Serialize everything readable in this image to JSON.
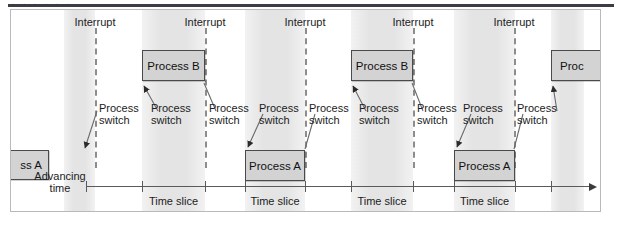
{
  "figure": {
    "caption_remnant": "· · · · · ·",
    "axis_label_line1": "Advancing",
    "axis_label_line2": "time",
    "interrupt_label": "Interrupt",
    "process_switch_line1": "Process",
    "process_switch_line2": "switch",
    "time_slice_label": "Time slice",
    "colors": {
      "band_gray": "#e9e9e9",
      "box_fill": "#d3d3d3",
      "box_border": "#4a4a4a",
      "dash_line": "#8d8d8d",
      "axis": "#5a5a5a",
      "rule": "#3c3c44",
      "frame": "#b9b9b9"
    }
  },
  "interrupts": [
    {
      "label": "Interrupt",
      "x": 84
    },
    {
      "label": "Interrupt",
      "x": 194
    },
    {
      "label": "Interrupt",
      "x": 294
    },
    {
      "label": "Interrupt",
      "x": 402
    },
    {
      "label": "Interrupt",
      "x": 503
    }
  ],
  "bands": [
    {
      "x": 53,
      "width": 31
    },
    {
      "x": 131,
      "width": 63
    },
    {
      "x": 234,
      "width": 60
    },
    {
      "x": 340,
      "width": 62
    },
    {
      "x": 443,
      "width": 61
    },
    {
      "x": 540,
      "width": 33
    }
  ],
  "process_boxes": [
    {
      "label": "ss A",
      "full": "Process A",
      "x": -8,
      "y": 140,
      "width": 46,
      "height": 30,
      "clipped": "left"
    },
    {
      "label": "Process B",
      "full": "Process B",
      "x": 131,
      "y": 40,
      "width": 63,
      "height": 31,
      "clipped": "none"
    },
    {
      "label": "Process A",
      "full": "Process A",
      "x": 234,
      "y": 140,
      "width": 60,
      "height": 31,
      "clipped": "none"
    },
    {
      "label": "Process B",
      "full": "Process B",
      "x": 340,
      "y": 40,
      "width": 62,
      "height": 31,
      "clipped": "none"
    },
    {
      "label": "Process A",
      "full": "Process A",
      "x": 443,
      "y": 140,
      "width": 61,
      "height": 31,
      "clipped": "none"
    },
    {
      "label": "Proc",
      "full": "Process B",
      "x": 540,
      "y": 40,
      "width": 52,
      "height": 31,
      "clipped": "right"
    }
  ],
  "process_switches": [
    {
      "line1": "Process",
      "line2": "switch",
      "x": 88,
      "y": 92
    },
    {
      "line1": "Process",
      "line2": "switch",
      "x": 140,
      "y": 92
    },
    {
      "line1": "Process",
      "line2": "switch",
      "x": 198,
      "y": 92
    },
    {
      "line1": "Process",
      "line2": "switch",
      "x": 248,
      "y": 92
    },
    {
      "line1": "Process",
      "line2": "switch",
      "x": 298,
      "y": 92
    },
    {
      "line1": "Process",
      "line2": "switch",
      "x": 348,
      "y": 92
    },
    {
      "line1": "Process",
      "line2": "switch",
      "x": 406,
      "y": 92
    },
    {
      "line1": "Process",
      "line2": "switch",
      "x": 452,
      "y": 92
    },
    {
      "line1": "Process",
      "line2": "switch",
      "x": 506,
      "y": 92
    }
  ],
  "time_slices": [
    {
      "label": "Time slice",
      "x": 131,
      "width": 63
    },
    {
      "label": "Time slice",
      "x": 234,
      "width": 60
    },
    {
      "label": "Time slice",
      "x": 340,
      "width": 62
    },
    {
      "label": "Time slice",
      "x": 443,
      "width": 61
    }
  ],
  "axis": {
    "label_line1": "Advancing",
    "label_line2": "time",
    "x_start": 75,
    "x_end": 578,
    "y": 176,
    "ticks": [
      75,
      131,
      194,
      234,
      294,
      340,
      402,
      443,
      504,
      540
    ]
  }
}
